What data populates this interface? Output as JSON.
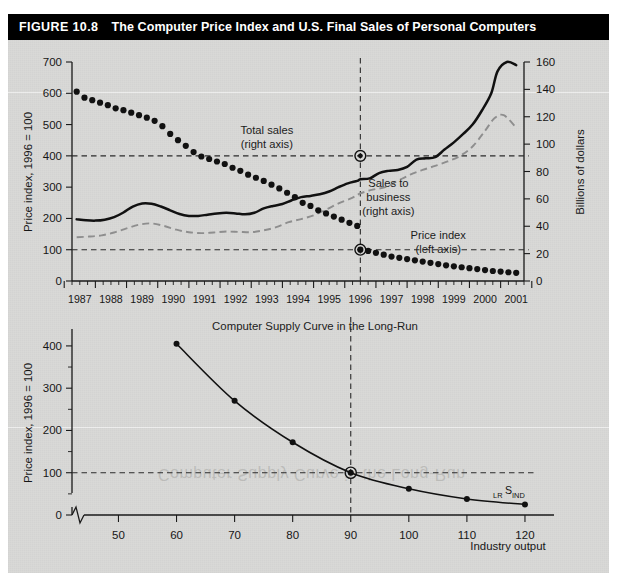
{
  "figure": {
    "number": "FIGURE 10.8",
    "title": "The Computer Price Index and U.S. Final Sales of Personal Computers",
    "banner_color": "#000000",
    "plate_color": "#d9d9d7"
  },
  "chart_data": [
    {
      "type": "line",
      "id": "top-chart",
      "title": "",
      "xlabel": "",
      "ylabel": "Price index, 1996 = 100",
      "y2label": "Billions of dollars",
      "xlim": [
        1986.75,
        2001.25
      ],
      "ylim": [
        0,
        700
      ],
      "y2lim": [
        0,
        160
      ],
      "yticks": [
        0,
        100,
        200,
        300,
        400,
        500,
        600,
        700
      ],
      "y2ticks": [
        0,
        20,
        40,
        60,
        80,
        100,
        120,
        140,
        160
      ],
      "xticks": [
        1987,
        1988,
        1989,
        1990,
        1991,
        1992,
        1993,
        1994,
        1995,
        1996,
        1997,
        1998,
        1999,
        2000,
        2001
      ],
      "xtick_labels": [
        "1987",
        "1988",
        "1989",
        "1990",
        "1991",
        "1992",
        "1993",
        "1994",
        "1995",
        "1996",
        "1997",
        "1998",
        "1999",
        "2000",
        "2001"
      ],
      "grid": false,
      "minor_ticks_per_year": 4,
      "annotations": [
        {
          "name": "total-sales-label",
          "text": "Total sales\n(right axis)",
          "lines": [
            "Total sales",
            "(right axis)"
          ],
          "x": 1993.0,
          "y": 470
        },
        {
          "name": "sales-to-business-label",
          "text": "Sales to\nbusiness\n(right axis)",
          "lines": [
            "Sales to",
            "business",
            "(right axis)"
          ],
          "x": 1996.9,
          "y": 300
        },
        {
          "name": "price-index-label",
          "text": "Price index\n(left axis)",
          "lines": [
            "Price index",
            "(left axis)"
          ],
          "x": 1998.5,
          "y": 135
        }
      ],
      "reference_lines": [
        {
          "name": "vline-1996",
          "orientation": "vertical",
          "value": 1996
        },
        {
          "name": "hline-total-sales-1996",
          "orientation": "horizontal",
          "value": 400,
          "axis": "left"
        },
        {
          "name": "hline-price-index-1996",
          "orientation": "horizontal",
          "value": 100,
          "axis": "left"
        }
      ],
      "highlight_points": [
        {
          "name": "total-sales-1996",
          "x": 1996,
          "y": 400
        },
        {
          "name": "price-index-1996",
          "x": 1996,
          "y": 100
        }
      ],
      "series": [
        {
          "name": "Total sales (right axis)",
          "style": "solid-black",
          "axis": "right",
          "x": [
            1986.9,
            1987.2,
            1987.5,
            1987.8,
            1988.1,
            1988.4,
            1988.7,
            1989.0,
            1989.3,
            1989.6,
            1989.9,
            1990.2,
            1990.5,
            1990.8,
            1991.1,
            1991.4,
            1991.7,
            1992.0,
            1992.3,
            1992.6,
            1992.9,
            1993.2,
            1993.5,
            1993.8,
            1994.1,
            1994.4,
            1994.7,
            1995.0,
            1995.3,
            1995.6,
            1995.9,
            1996.0,
            1996.3,
            1996.6,
            1996.9,
            1997.2,
            1997.5,
            1997.8,
            1998.1,
            1998.4,
            1998.7,
            1999.0,
            1999.3,
            1999.6,
            1999.9,
            2000.2,
            2000.4,
            2000.7,
            2001.0
          ],
          "values_index": [
            197,
            194,
            193,
            196,
            204,
            219,
            238,
            248,
            247,
            238,
            226,
            214,
            208,
            208,
            212,
            216,
            218,
            216,
            213,
            218,
            232,
            240,
            246,
            258,
            268,
            272,
            277,
            286,
            300,
            312,
            320,
            325,
            328,
            345,
            352,
            355,
            365,
            388,
            392,
            396,
            420,
            443,
            470,
            500,
            545,
            600,
            670,
            700,
            690,
            620
          ],
          "values_billions": [
            45,
            44,
            44,
            45,
            47,
            50,
            54,
            57,
            56,
            54,
            52,
            49,
            48,
            48,
            48,
            49,
            50,
            49,
            49,
            50,
            53,
            55,
            56,
            59,
            61,
            62,
            63,
            65,
            69,
            71,
            73,
            74,
            75,
            79,
            80,
            81,
            83,
            89,
            90,
            91,
            96,
            101,
            107,
            114,
            125,
            137,
            153,
            160,
            158,
            142
          ]
        },
        {
          "name": "Sales to business (right axis)",
          "style": "dashed-gray",
          "axis": "right",
          "x": [
            1986.9,
            1987.3,
            1987.7,
            1988.1,
            1988.5,
            1988.9,
            1989.3,
            1989.7,
            1990.1,
            1990.5,
            1990.9,
            1991.3,
            1991.7,
            1992.1,
            1992.5,
            1992.9,
            1993.3,
            1993.7,
            1994.1,
            1994.5,
            1994.9,
            1995.3,
            1995.7,
            1996.0,
            1996.4,
            1996.8,
            1997.2,
            1997.6,
            1998.0,
            1998.4,
            1998.8,
            1999.2,
            1999.6,
            2000.0,
            2000.3,
            2000.6,
            2001.0
          ],
          "values_index": [
            140,
            142,
            146,
            155,
            168,
            180,
            184,
            176,
            164,
            156,
            153,
            155,
            158,
            157,
            156,
            162,
            172,
            188,
            198,
            210,
            228,
            248,
            264,
            280,
            292,
            300,
            320,
            340,
            355,
            368,
            382,
            400,
            430,
            480,
            520,
            530,
            490
          ],
          "values_billions": [
            32,
            33,
            33,
            35,
            38,
            41,
            42,
            40,
            38,
            36,
            35,
            35,
            36,
            36,
            36,
            37,
            39,
            43,
            45,
            48,
            52,
            57,
            60,
            64,
            67,
            69,
            73,
            78,
            81,
            84,
            87,
            91,
            98,
            110,
            119,
            121,
            112
          ]
        },
        {
          "name": "Price index (left axis)",
          "style": "dotted-black",
          "axis": "left",
          "x": [
            1986.9,
            1987.15,
            1987.4,
            1987.65,
            1987.9,
            1988.15,
            1988.4,
            1988.65,
            1988.9,
            1989.15,
            1989.4,
            1989.65,
            1989.9,
            1990.15,
            1990.4,
            1990.65,
            1990.9,
            1991.15,
            1991.4,
            1991.65,
            1991.9,
            1992.15,
            1992.4,
            1992.65,
            1992.9,
            1993.15,
            1993.4,
            1993.65,
            1993.9,
            1994.15,
            1994.4,
            1994.65,
            1994.9,
            1995.15,
            1995.4,
            1995.65,
            1995.9,
            1996.0,
            1996.25,
            1996.5,
            1996.75,
            1997.0,
            1997.25,
            1997.5,
            1997.75,
            1998.0,
            1998.25,
            1998.5,
            1998.75,
            1999.0,
            1999.25,
            1999.5,
            1999.75,
            2000.0,
            2000.25,
            2000.5,
            2000.75,
            2001.0
          ],
          "values": [
            605,
            586,
            578,
            570,
            562,
            552,
            546,
            538,
            530,
            522,
            512,
            495,
            470,
            450,
            432,
            412,
            398,
            390,
            382,
            374,
            362,
            352,
            340,
            330,
            320,
            308,
            296,
            282,
            268,
            250,
            240,
            226,
            216,
            206,
            196,
            186,
            176,
            100,
            96,
            90,
            84,
            78,
            74,
            70,
            66,
            62,
            58,
            54,
            50,
            47,
            44,
            41,
            38,
            35,
            32,
            30,
            28,
            26
          ]
        }
      ]
    },
    {
      "type": "line",
      "id": "bottom-chart",
      "title": "Computer Supply Curve in the Long-Run",
      "xlabel": "Industry output",
      "ylabel": "Price index, 1996 = 100",
      "xlim": [
        42,
        125
      ],
      "ylim": [
        0,
        440
      ],
      "yticks": [
        0,
        100,
        200,
        300,
        400
      ],
      "xticks": [
        50,
        60,
        70,
        80,
        90,
        100,
        110,
        120
      ],
      "grid": false,
      "axis_break": true,
      "curve_label": {
        "prefix": "LR",
        "main": "S",
        "suffix": "IND"
      },
      "reference_lines": [
        {
          "name": "vline-90",
          "orientation": "vertical",
          "value": 90
        },
        {
          "name": "hline-100",
          "orientation": "horizontal",
          "value": 100
        }
      ],
      "highlight_points": [
        {
          "name": "equilibrium-90-100",
          "x": 90,
          "y": 100
        }
      ],
      "series": [
        {
          "name": "LR industry supply",
          "style": "solid-black-with-dots",
          "x": [
            60,
            70,
            80,
            90,
            100,
            110,
            120
          ],
          "values": [
            405,
            270,
            172,
            100,
            62,
            38,
            25
          ]
        }
      ]
    }
  ],
  "watermark": {
    "text": "Computer Supply Curve in the Long-Run"
  }
}
